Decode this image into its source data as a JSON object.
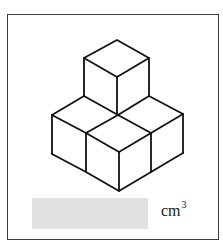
{
  "figure": {
    "cube_count": 4,
    "stroke_color": "#111111"
  },
  "answer": {
    "value": "",
    "placeholder_color": "#e1e1e1",
    "unit": "cm",
    "unit_exponent": "3"
  }
}
